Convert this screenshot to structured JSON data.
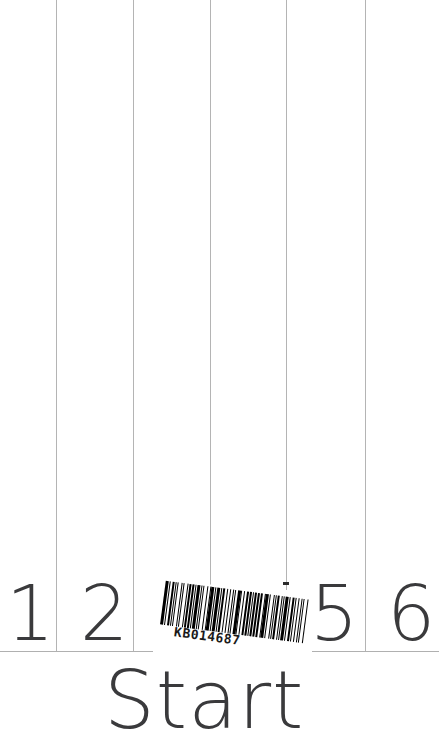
{
  "page": {
    "width": 439,
    "height": 749,
    "background_color": "#ffffff",
    "ink_color": "#3a3a3c",
    "rule_color": "#b4b4b4"
  },
  "column_rules": [
    {
      "name": "column-rule-1",
      "x": 56,
      "top": 0,
      "bottom": 651
    },
    {
      "name": "column-rule-2",
      "x": 133,
      "top": 0,
      "bottom": 651
    },
    {
      "name": "column-rule-3",
      "x": 210,
      "top": 0,
      "bottom": 586
    },
    {
      "name": "column-rule-4",
      "x": 286,
      "top": 0,
      "bottom": 590
    },
    {
      "name": "column-rule-5",
      "x": 365,
      "top": 0,
      "bottom": 651
    }
  ],
  "baseline_segments": [
    {
      "name": "baseline-left",
      "x": 0,
      "y": 651,
      "width": 153
    },
    {
      "name": "baseline-right",
      "x": 312,
      "y": 651,
      "width": 127
    }
  ],
  "digit_row": {
    "label": "numbered-column-headers",
    "baseline_y": 651,
    "cells": [
      {
        "value": "1",
        "x": 6,
        "y": 576,
        "visible": true,
        "occluded_by": ""
      },
      {
        "value": "2",
        "x": 80,
        "y": 576,
        "visible": true,
        "occluded_by": ""
      },
      {
        "value": "3",
        "x": 157,
        "y": 576,
        "visible": false,
        "occluded_by": "barcode-sticker"
      },
      {
        "value": "4",
        "x": 233,
        "y": 576,
        "visible": false,
        "occluded_by": "barcode-sticker"
      },
      {
        "value": "5",
        "x": 310,
        "y": 576,
        "visible": true,
        "occluded_by": ""
      },
      {
        "value": "6",
        "x": 387,
        "y": 576,
        "visible": true,
        "occluded_by": ""
      }
    ]
  },
  "barcode": {
    "name": "barcode-sticker",
    "human_readable_number": "KB014687",
    "symbology_appearance": "code-39-style linear barcode",
    "rotation_degrees": 7.5,
    "x": 158,
    "y": 588,
    "width": 152,
    "height": 68,
    "bar_color": "#000000",
    "sticker_background": "#ffffff",
    "bar_widths": [
      3,
      2,
      1,
      2,
      3,
      1,
      1,
      2,
      1,
      3,
      2,
      1,
      1,
      3,
      1,
      2,
      2,
      1,
      3,
      1,
      1,
      2,
      3,
      1,
      2,
      1,
      1,
      3,
      2,
      2,
      1,
      1,
      3,
      1,
      2,
      1,
      3,
      2,
      1,
      1,
      2,
      3,
      1,
      2,
      1,
      3,
      1,
      1,
      2,
      2,
      3,
      1,
      1,
      2,
      1,
      3,
      2,
      1,
      3,
      1,
      1,
      2,
      2,
      1,
      3,
      1,
      2,
      2,
      1,
      1,
      3,
      2,
      1,
      3,
      1,
      2,
      1,
      1,
      2,
      3,
      1,
      1,
      2,
      1,
      3,
      2,
      1,
      2,
      3,
      1,
      1,
      3,
      1,
      2,
      1,
      2,
      1,
      3,
      2,
      1
    ],
    "bar_gap_pattern_note": "alternating bars and spaces, leftmost element is a bar"
  },
  "specks": [
    {
      "name": "scan-speck-1",
      "x": 283,
      "y": 582,
      "width": 6,
      "height": 3
    }
  ],
  "form_title": {
    "name": "form-title",
    "text": "Start",
    "clipped": true,
    "clipped_note": "final letter runs past the right crop edge"
  }
}
